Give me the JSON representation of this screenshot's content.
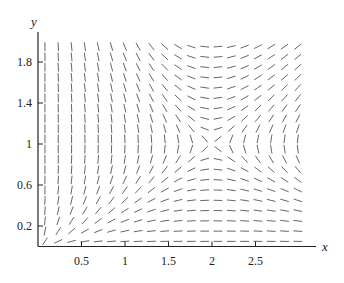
{
  "chart_data": {
    "type": "slope_field",
    "title": "",
    "xlabel": "x",
    "ylabel": "y",
    "equation_hint": "dy/dx = y(2 - x) / (x(1 - y))",
    "xlim": [
      0,
      3.2
    ],
    "ylim": [
      0,
      2.0
    ],
    "grid": false,
    "legend": null,
    "x_ticks": [
      {
        "value": 0.5,
        "label": "0.5"
      },
      {
        "value": 1,
        "label": "1"
      },
      {
        "value": 1.5,
        "label": "1.5"
      },
      {
        "value": 2,
        "label": "2"
      },
      {
        "value": 2.5,
        "label": "2.5"
      }
    ],
    "y_ticks": [
      {
        "value": 0.2,
        "label": "0.2"
      },
      {
        "value": 0.6,
        "label": "0.6"
      },
      {
        "value": 1,
        "label": "1"
      },
      {
        "value": 1.4,
        "label": "1.4"
      },
      {
        "value": 1.8,
        "label": "1.8"
      }
    ],
    "field_grid": {
      "x_start": 0.08,
      "x_step": 0.153,
      "x_count": 20,
      "y_start": 0.05,
      "y_step": 0.1,
      "y_count": 20
    },
    "segment_length_px": 8,
    "colors": {
      "axis": "#222222",
      "segment": "#555555",
      "text": "#222222"
    }
  },
  "layout": {
    "origin_px": [
      38,
      246.5
    ],
    "px_per_unit_x": 87,
    "px_per_unit_y": 102.5,
    "x_axis_end_px": 316,
    "y_axis_top_px": 32
  }
}
